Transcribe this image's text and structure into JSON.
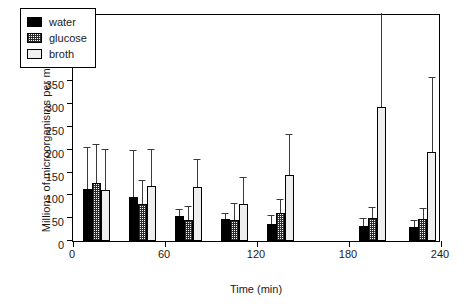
{
  "chart_data": {
    "type": "bar",
    "title": "",
    "subtitle": "",
    "xlabel": "Time (min)",
    "ylabel": "Millions of microorganisms per milliliter",
    "xlim": [
      0,
      240
    ],
    "ylim": [
      0,
      500
    ],
    "xticks": [
      0,
      60,
      120,
      180,
      240
    ],
    "yticks": [
      0,
      50,
      100,
      150,
      200,
      250,
      300,
      350,
      400,
      450,
      500
    ],
    "grid": false,
    "legend_position": "top-left",
    "legend": [
      "water",
      "glucose",
      "broth"
    ],
    "x": [
      15,
      45,
      75,
      105,
      135,
      195,
      228
    ],
    "categories": [
      "15",
      "45",
      "75",
      "105",
      "135",
      "195",
      "228"
    ],
    "series": [
      {
        "name": "water",
        "color": "#000000",
        "pattern": "solid",
        "values": [
          113,
          97,
          55,
          48,
          38,
          33,
          30
        ],
        "errors_upper": [
          203,
          197,
          68,
          60,
          54,
          48,
          44
        ]
      },
      {
        "name": "glucose",
        "color": "#ffffff",
        "pattern": "checkered",
        "values": [
          128,
          82,
          47,
          47,
          62,
          50,
          48
        ],
        "errors_upper": [
          210,
          132,
          74,
          82,
          90,
          72,
          70
        ]
      },
      {
        "name": "broth",
        "color": "#eeeeee",
        "pattern": "plain",
        "values": [
          112,
          120,
          118,
          82,
          145,
          293,
          195
        ],
        "errors_upper": [
          200,
          199,
          177,
          138,
          232,
          500,
          357
        ]
      }
    ]
  },
  "axis": {
    "ytick_labels": [
      "0",
      "50",
      "100",
      "150",
      "200",
      "250",
      "300",
      "350",
      "400",
      "450",
      "500"
    ],
    "xtick_labels": [
      "0",
      "60",
      "120",
      "180",
      "240"
    ],
    "xlabel": "Time (min)",
    "ylabel": "Millions of microorganisms per milliliter"
  },
  "legend": {
    "items": [
      {
        "label": "water",
        "key": "water"
      },
      {
        "label": "glucose",
        "key": "glucose"
      },
      {
        "label": "broth",
        "key": "broth"
      }
    ]
  }
}
